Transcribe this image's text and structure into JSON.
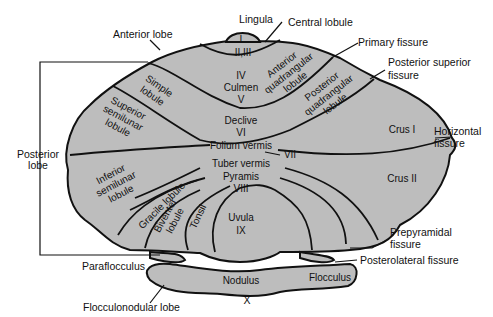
{
  "diagram": {
    "fill_color": "#bdbdbd",
    "outline_color": "#111111",
    "external_labels": {
      "lingula": "Lingula",
      "central_lobule": "Central lobule",
      "anterior_lobe": "Anterior lobe",
      "primary_fissure": "Primary fissure",
      "posterior_superior_fissure_1": "Posterior superior",
      "posterior_superior_fissure_2": "fissure",
      "horizontal_fissure_1": "Horizontal",
      "horizontal_fissure_2": "fissure",
      "posterior_lobe_1": "Posterior",
      "posterior_lobe_2": "lobe",
      "prepyramidal_fissure_1": "Prepyramidal",
      "prepyramidal_fissure_2": "fissure",
      "posterolateral_fissure": "Posterolateral fissure",
      "paraflocculus": "Paraflocculus",
      "flocculonodular_lobe": "Flocculonodular lobe"
    },
    "internal_labels": {
      "lobule_I": "I",
      "lobule_II_III": "II,III",
      "lobule_IV": "IV",
      "culmen": "Culmen",
      "lobule_V": "V",
      "anterior_quadrangular_1": "Anterior",
      "anterior_quadrangular_2": "quadrangular",
      "anterior_quadrangular_3": "lobule",
      "posterior_quadrangular_1": "Posterior",
      "posterior_quadrangular_2": "quadrangular",
      "posterior_quadrangular_3": "lobule",
      "simple_1": "Simple",
      "simple_2": "lobule",
      "superior_semilunar_1": "Superior",
      "superior_semilunar_2": "semilunar",
      "superior_semilunar_3": "lobule",
      "declive": "Declive",
      "lobule_VI": "VI",
      "folium_vermis": "Folium vermis",
      "lobule_VII": "VII",
      "tuber_vermis": "Tuber vermis",
      "pyramis": "Pyramis",
      "lobule_VIII": "VIII",
      "crus_I": "Crus I",
      "crus_II": "Crus II",
      "inferior_semilunar_1": "Inferior",
      "inferior_semilunar_2": "semilunar",
      "inferior_semilunar_3": "lobule",
      "gracile_lobule": "Gracile lobule",
      "biventer_1": "Biventer",
      "biventer_2": "lobule",
      "tonsil": "Tonsil",
      "uvula": "Uvula",
      "lobule_IX": "IX",
      "nodulus": "Nodulus",
      "lobule_X": "X",
      "flocculus": "Flocculus"
    }
  }
}
